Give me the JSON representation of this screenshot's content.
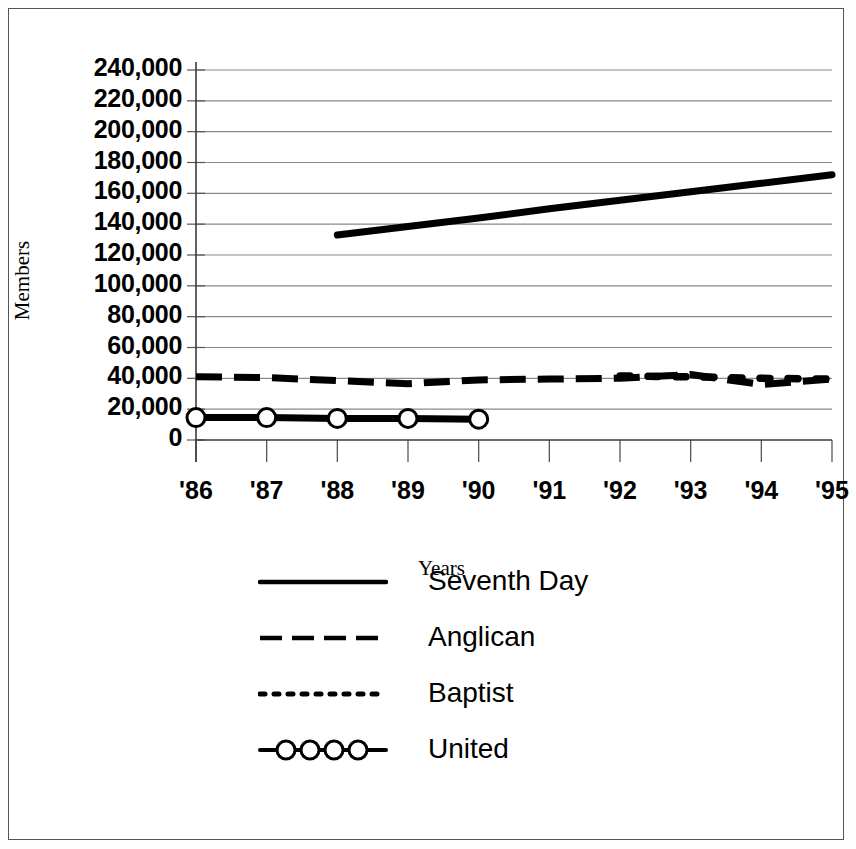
{
  "chart_data": {
    "type": "line",
    "title": "",
    "xlabel": "Years",
    "ylabel": "Members",
    "ylim": [
      0,
      240000
    ],
    "ytick_values": [
      240000,
      220000,
      200000,
      180000,
      160000,
      140000,
      120000,
      100000,
      80000,
      60000,
      40000,
      20000,
      0
    ],
    "ytick_labels": [
      "240,000",
      "220,000",
      "200,000",
      "180,000",
      "160,000",
      "140,000",
      "120,000",
      "100,000",
      "80,000",
      "60,000",
      "40,000",
      "20,000",
      "0"
    ],
    "categories": [
      "'86",
      "'87",
      "'88",
      "'89",
      "'90",
      "'91",
      "'92",
      "'93",
      "'94",
      "'95"
    ],
    "grid": true,
    "legend_position": "bottom",
    "series": [
      {
        "name": "Seventh Day",
        "style": "solid",
        "color": "#000000",
        "x": [
          "'88",
          "'89",
          "'90",
          "'91",
          "'92",
          "'93",
          "'94",
          "'95"
        ],
        "values": [
          133000,
          138500,
          144000,
          150000,
          155500,
          161000,
          166500,
          172000
        ]
      },
      {
        "name": "Anglican",
        "style": "dashed",
        "color": "#000000",
        "x": [
          "'86",
          "'87",
          "'88",
          "'89",
          "'90",
          "'91",
          "'92",
          "'93",
          "'94",
          "'95"
        ],
        "values": [
          41000,
          40500,
          38500,
          36500,
          39000,
          39500,
          40000,
          42500,
          36000,
          39500
        ]
      },
      {
        "name": "Baptist",
        "style": "dotted",
        "color": "#000000",
        "x": [
          "'92",
          "'93",
          "'94",
          "'95"
        ],
        "values": [
          41500,
          41000,
          40000,
          39500
        ]
      },
      {
        "name": "United",
        "style": "solid-circle-markers",
        "color": "#000000",
        "x": [
          "'86",
          "'87",
          "'88",
          "'89",
          "'90"
        ],
        "values": [
          14500,
          14500,
          14000,
          14000,
          13500
        ]
      }
    ]
  },
  "axis": {
    "ylabel": "Members",
    "xlabel": "Years"
  },
  "yticks": [
    {
      "label": "240,000"
    },
    {
      "label": "220,000"
    },
    {
      "label": "200,000"
    },
    {
      "label": "180,000"
    },
    {
      "label": "160,000"
    },
    {
      "label": "140,000"
    },
    {
      "label": "120,000"
    },
    {
      "label": "100,000"
    },
    {
      "label": "80,000"
    },
    {
      "label": "60,000"
    },
    {
      "label": "40,000"
    },
    {
      "label": "20,000"
    },
    {
      "label": "0"
    }
  ],
  "xticks": [
    {
      "label": "'86"
    },
    {
      "label": "'87"
    },
    {
      "label": "'88"
    },
    {
      "label": "'89"
    },
    {
      "label": "'90"
    },
    {
      "label": "'91"
    },
    {
      "label": "'92"
    },
    {
      "label": "'93"
    },
    {
      "label": "'94"
    },
    {
      "label": "'95"
    }
  ],
  "legend": {
    "items": [
      {
        "label": "Seventh Day",
        "style": "solid"
      },
      {
        "label": "Anglican",
        "style": "dashed"
      },
      {
        "label": "Baptist",
        "style": "dotted"
      },
      {
        "label": "United",
        "style": "circle-markers"
      }
    ]
  }
}
